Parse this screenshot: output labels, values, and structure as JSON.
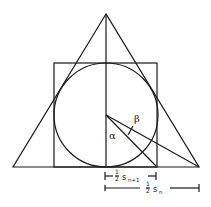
{
  "diagram": {
    "labels": {
      "alpha": "α",
      "beta": "β",
      "half_s_n1_frac": "1/2",
      "half_s_n1_var": "s",
      "half_s_n1_sub": "n+1",
      "half_s_n_frac": "1/2",
      "half_s_n_var": "s",
      "half_s_n_sub": "n"
    },
    "colors": {
      "stroke": "#1a1a1a",
      "background": "#ffffff"
    }
  }
}
